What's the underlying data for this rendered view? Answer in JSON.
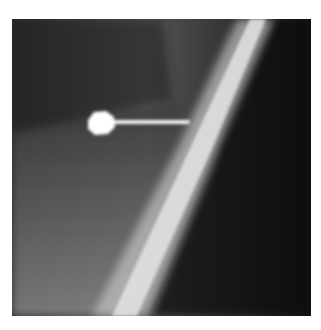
{
  "image": {
    "description": "Grayscale radiograph showing a diagonal bright bone band with a pin-shaped radiopaque marker inserted from the left",
    "colors": {
      "background": "#ffffff",
      "film_dark": "#1a1a1a",
      "bone_bright": "#e6e6e6",
      "marker": "#ffffff"
    }
  }
}
